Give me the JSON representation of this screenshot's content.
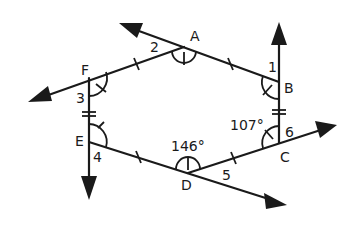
{
  "vertices": {
    "A": "A",
    "B": "B",
    "C": "C",
    "D": "D",
    "E": "E",
    "F": "F"
  },
  "angle_labels": {
    "n1": "1",
    "n2": "2",
    "n3": "3",
    "n4": "4",
    "n5": "5",
    "n6": "6"
  },
  "given_angles": {
    "at_D": "146°",
    "at_C": "107°"
  },
  "colors": {
    "stroke": "#1a1a1a",
    "background": "#ffffff"
  }
}
